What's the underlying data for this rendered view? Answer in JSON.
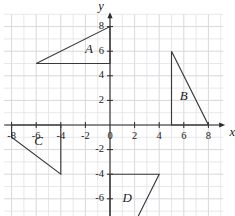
{
  "chart_data": {
    "type": "scatter",
    "title": "",
    "xlabel": "x",
    "ylabel": "y",
    "xlim": [
      -8.6,
      9.2
    ],
    "ylim": [
      -8.6,
      9.0
    ],
    "grid": true,
    "grid_step": 1,
    "legend": "none",
    "x_ticks": [
      -8,
      -6,
      -4,
      -2,
      0,
      2,
      4,
      6,
      8
    ],
    "y_ticks": [
      8,
      6,
      4,
      2,
      0,
      -2,
      -4,
      -6,
      -8
    ],
    "x_tick_labels": [
      "-8",
      "-6",
      "-4",
      "-2",
      "0",
      "2",
      "4",
      "6",
      "8"
    ],
    "y_tick_labels": [
      "8",
      "6",
      "4",
      "2",
      "0",
      "-2",
      "-4",
      "-6",
      "-8"
    ],
    "origin_label": "0",
    "annotations": [
      "A",
      "B",
      "C",
      "D"
    ],
    "shapes": [
      {
        "name": "A",
        "kind": "triangle",
        "closed": true,
        "vertices": [
          [
            -6,
            5
          ],
          [
            0,
            5
          ],
          [
            0,
            8
          ]
        ],
        "label": "A",
        "label_position": [
          -1.7,
          6.1
        ]
      },
      {
        "name": "B",
        "kind": "triangle",
        "closed": true,
        "vertices": [
          [
            5,
            0
          ],
          [
            5,
            6
          ],
          [
            8,
            0
          ]
        ],
        "label": "B",
        "label_position": [
          6.0,
          2.3
        ]
      },
      {
        "name": "C",
        "kind": "trapezoid",
        "closed": true,
        "vertices": [
          [
            -8,
            0
          ],
          [
            -4,
            0
          ],
          [
            -4,
            -4
          ],
          [
            -8,
            -1
          ]
        ],
        "label": "C",
        "label_position": [
          -5.8,
          -1.4
        ]
      },
      {
        "name": "D",
        "kind": "trapezoid",
        "closed": true,
        "vertices": [
          [
            0,
            -4
          ],
          [
            4,
            -4
          ],
          [
            2,
            -8
          ],
          [
            0,
            -8
          ]
        ],
        "label": "D",
        "label_position": [
          1.4,
          -6.0
        ]
      }
    ],
    "colors": {
      "background": "#ffffff",
      "grid": "#e2e2e6",
      "axis": "#2b2b2b",
      "shape_stroke": "#3a3a3a",
      "text": "#1a1a1a"
    }
  }
}
